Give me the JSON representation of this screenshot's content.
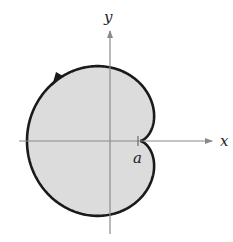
{
  "diagram": {
    "type": "polar-curve",
    "curve": "cardioid",
    "direction": "counterclockwise",
    "fill_color": "#dcdcdc",
    "stroke_color": "#1a1a1a",
    "axis_color": "#8a8a8a",
    "labels": {
      "x_axis": "x",
      "y_axis": "y",
      "cusp": "a"
    }
  }
}
